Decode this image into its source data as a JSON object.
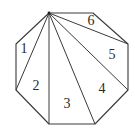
{
  "diagram": {
    "type": "triangulated-octagon",
    "colors": {
      "stroke": "#3a3a3a",
      "text": "#2a2a2a",
      "background": "#ffffff"
    },
    "vertices": [
      {
        "id": "A",
        "x": 49,
        "y": 13
      },
      {
        "id": "B",
        "x": 93,
        "y": 13
      },
      {
        "id": "C",
        "x": 128,
        "y": 44
      },
      {
        "id": "D",
        "x": 128,
        "y": 90
      },
      {
        "id": "E",
        "x": 95,
        "y": 124
      },
      {
        "id": "F",
        "x": 49,
        "y": 124
      },
      {
        "id": "G",
        "x": 16,
        "y": 90
      },
      {
        "id": "H",
        "x": 16,
        "y": 44
      }
    ],
    "apex": "A",
    "diagonals": [
      "C",
      "D",
      "E",
      "F",
      "G"
    ],
    "regions": [
      {
        "label": "1",
        "x": 24,
        "y": 50
      },
      {
        "label": "2",
        "x": 36,
        "y": 87
      },
      {
        "label": "3",
        "x": 67,
        "y": 105
      },
      {
        "label": "4",
        "x": 102,
        "y": 90
      },
      {
        "label": "5",
        "x": 112,
        "y": 56
      },
      {
        "label": "6",
        "x": 91,
        "y": 22
      }
    ]
  }
}
